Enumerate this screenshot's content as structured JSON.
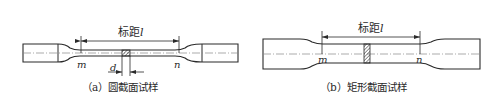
{
  "figure_a": {
    "gauge_label": "标距",
    "gauge_symbol": "l",
    "mark_left": "m",
    "mark_right": "n",
    "diameter_symbol": "d",
    "caption": "（a）圆截面试样"
  },
  "figure_b": {
    "gauge_label": "标距",
    "gauge_symbol": "l",
    "mark_left": "m",
    "mark_right": "n",
    "caption": "（b）矩形截面试样"
  },
  "colors": {
    "line": "#2a2a2a",
    "background": "#ffffff"
  }
}
